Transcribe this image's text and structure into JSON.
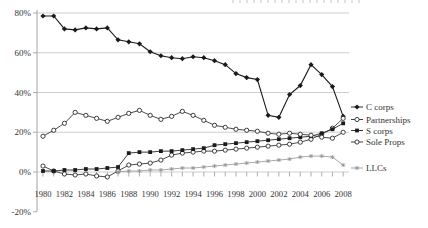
{
  "artifacts": {
    "top_edge": "thin sliver of cropped text above the 80% gridline"
  },
  "chart_data": {
    "type": "line",
    "title": "",
    "xlabel": "",
    "ylabel": "",
    "grid": "horizontal",
    "legend_position": "right-of-plot, rows roughly aligned to 2008 series endpoints",
    "ylim": [
      -20,
      80
    ],
    "yticks": [
      {
        "label": "80%",
        "value": 80
      },
      {
        "label": "60%",
        "value": 60
      },
      {
        "label": "40%",
        "value": 40
      },
      {
        "label": "20%",
        "value": 20
      },
      {
        "label": "0%",
        "value": 0
      },
      {
        "label": "-20%",
        "value": -20
      }
    ],
    "xtick_labels": [
      "1980",
      "1982",
      "1984",
      "1986",
      "1988",
      "1990",
      "1992",
      "1994",
      "1996",
      "1998",
      "2000",
      "2002",
      "2004",
      "2006",
      "2008"
    ],
    "x": [
      1980,
      1981,
      1982,
      1983,
      1984,
      1985,
      1986,
      1987,
      1988,
      1989,
      1990,
      1991,
      1992,
      1993,
      1994,
      1995,
      1996,
      1997,
      1998,
      1999,
      2000,
      2001,
      2002,
      2003,
      2004,
      2005,
      2006,
      2007,
      2008
    ],
    "series": [
      {
        "name": "C corps",
        "marker": "diamond-filled",
        "color": "#1a1a1a",
        "values": [
          78.5,
          78.5,
          72,
          71.5,
          72.5,
          72,
          72.5,
          66.5,
          65.5,
          64.5,
          60.5,
          58.5,
          57.5,
          57,
          58,
          57.5,
          56,
          54,
          49.5,
          47.5,
          46.5,
          28.5,
          27.5,
          39,
          43.5,
          54,
          49,
          43,
          28
        ]
      },
      {
        "name": "Partnerships",
        "marker": "circle-open",
        "color": "#2a2a2a",
        "values": [
          3,
          0.5,
          -1,
          -1.5,
          -1,
          -2,
          -2.5,
          0.5,
          3.5,
          4,
          4.5,
          6,
          8.5,
          9.5,
          10,
          10.5,
          10.5,
          11,
          11.5,
          12,
          12.5,
          13,
          13.5,
          14,
          15,
          16.5,
          19,
          22,
          27
        ]
      },
      {
        "name": "S corps",
        "marker": "square-filled",
        "color": "#1a1a1a",
        "values": [
          0.5,
          0.5,
          1,
          1,
          1.5,
          1.5,
          2,
          2.5,
          9.5,
          10,
          10,
          10.5,
          10.5,
          11,
          11.5,
          12,
          13.5,
          14,
          14.5,
          15,
          15.5,
          16,
          16.5,
          17,
          17.5,
          18,
          19.5,
          21.5,
          24.5
        ]
      },
      {
        "name": "Sole Props",
        "marker": "circle-open",
        "color": "#2a2a2a",
        "values": [
          18,
          21,
          24.5,
          30,
          28.5,
          27,
          25.5,
          27.5,
          29.5,
          31,
          28.5,
          26.5,
          28,
          30.5,
          28.5,
          26,
          23.5,
          22.5,
          21.5,
          21,
          20.5,
          19.5,
          19,
          19.5,
          19,
          18.5,
          17.5,
          17,
          20
        ]
      },
      {
        "name": "LLCs",
        "marker": "asterisk",
        "color": "#999999",
        "values": [
          null,
          null,
          null,
          null,
          null,
          null,
          null,
          0,
          0.5,
          0.5,
          1,
          1,
          1.5,
          2,
          2,
          2.5,
          3,
          3.5,
          4,
          4.5,
          5,
          5.5,
          6,
          6.5,
          7.5,
          8,
          8,
          7.5,
          3.5
        ]
      }
    ],
    "colors": {
      "grid": "#b9b9b9",
      "axis": "#999999",
      "text": "#333333"
    }
  }
}
